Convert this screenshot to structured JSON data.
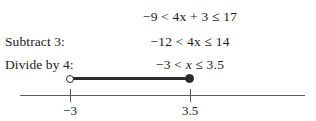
{
  "figure": {
    "type": "inequality-solution-with-number-line",
    "steps": [
      {
        "label": "",
        "equation": "−9 < 4x + 3 ≤ 17"
      },
      {
        "label": "Subtract 3:",
        "equation": "−12 < 4x ≤ 14"
      },
      {
        "label": "Divide by 4:",
        "equation": "−3 < x ≤ 3.5"
      }
    ],
    "number_line": {
      "ticks": [
        {
          "label": "−3",
          "value": -3,
          "endpoint": "open"
        },
        {
          "label": "3.5",
          "value": 3.5,
          "endpoint": "closed"
        }
      ],
      "segment": {
        "from": -3,
        "to": 3.5,
        "left_endpoint": "open",
        "right_endpoint": "closed"
      }
    },
    "colors": {
      "ink": "#1a1a1a",
      "axis": "#5a5a5a",
      "segment": "#2b2b2b",
      "background": "#ffffff"
    }
  }
}
